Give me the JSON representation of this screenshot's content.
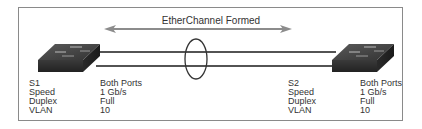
{
  "title": "EtherChannel Formed",
  "switches": [
    {
      "name": "S1",
      "rows": [
        {
          "key": "Speed",
          "value": "1 Gb/s"
        },
        {
          "key": "Duplex",
          "value": "Full"
        },
        {
          "key": "VLAN",
          "value": "10"
        }
      ],
      "column_header": "Both Ports"
    },
    {
      "name": "S2",
      "rows": [
        {
          "key": "Speed",
          "value": "1 Gb/s"
        },
        {
          "key": "Duplex",
          "value": "Full"
        },
        {
          "key": "VLAN",
          "value": "10"
        }
      ],
      "column_header": "Both Ports"
    }
  ],
  "colors": {
    "switch_body": "#2e2e2e",
    "switch_top": "#4a4a4a",
    "link_line": "#1a1a1a",
    "arrow": "#8c8c8c",
    "frame_border": "#8a8a8a",
    "text": "#333333"
  }
}
